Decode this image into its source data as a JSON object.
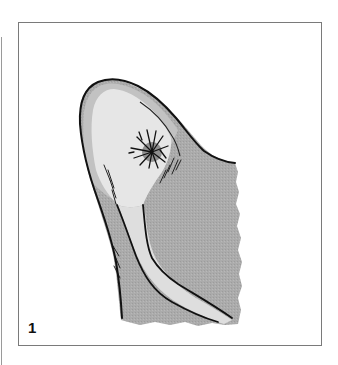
{
  "figure": {
    "label": "1",
    "colors": {
      "outline": "#111111",
      "frame": "#7a7a7a",
      "skin_dark": "#a9a9a9",
      "skin_mid": "#bdbdbd",
      "skin_light": "#e4e4e4",
      "lesion": "#8f8f8f",
      "background": "#ffffff"
    },
    "icons": [
      "ear-illustration",
      "lesion-starburst"
    ]
  }
}
